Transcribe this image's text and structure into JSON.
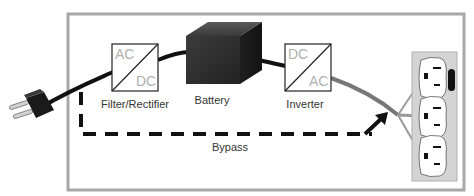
{
  "diagram": {
    "components": {
      "filter": {
        "label": "Filter/Rectifier",
        "input": "AC",
        "output": "DC"
      },
      "battery": {
        "label": "Battery"
      },
      "inverter": {
        "label": "Inverter",
        "input": "DC",
        "output": "AC"
      },
      "bypass": {
        "label": "Bypass"
      },
      "plug": {
        "icon": "power-plug-icon"
      },
      "outlets": {
        "icon": "outlet-strip-icon",
        "count": 3
      }
    },
    "colors": {
      "frame": "#a8a8a8",
      "cable": "#111111",
      "output_cable": "#8a8a8a",
      "outlet_strip": "#d4d4d4",
      "box_text": "#b0b0b0",
      "label_text": "#333333"
    }
  }
}
